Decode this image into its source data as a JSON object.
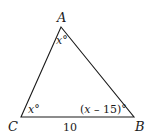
{
  "diagram": {
    "type": "triangle",
    "vertices": {
      "A": {
        "label": "A",
        "x": 61,
        "y": 27
      },
      "B": {
        "label": "B",
        "x": 134,
        "y": 117
      },
      "C": {
        "label": "C",
        "x": 21,
        "y": 117
      }
    },
    "angles": {
      "A": {
        "var": "x",
        "suffix": "°",
        "text": "x°"
      },
      "C": {
        "var": "x",
        "suffix": "°",
        "text": "x°"
      },
      "B": {
        "prefix": "(",
        "var": "x",
        "rest": " – 15)°",
        "text": "(x – 15)°"
      }
    },
    "sides": {
      "CB": {
        "label": "10"
      }
    },
    "stroke_color": "#1a1a1a"
  }
}
